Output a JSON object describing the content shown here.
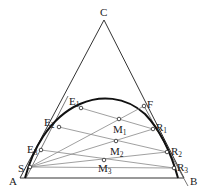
{
  "diagram": {
    "type": "ternary-phase-diagram",
    "vertices": {
      "apex": {
        "label": "C",
        "x": 104,
        "y": 20
      },
      "bottom_left": {
        "label": "A",
        "x": 20,
        "y": 178
      },
      "bottom_right": {
        "label": "B",
        "x": 184,
        "y": 178
      }
    },
    "points": {
      "S": {
        "label": "S",
        "x": 30,
        "y": 167
      },
      "F": {
        "label": "F",
        "x": 144,
        "y": 106
      },
      "E1": {
        "label": "E",
        "sub": "1",
        "x": 81,
        "y": 108
      },
      "E2": {
        "label": "E",
        "sub": "2",
        "x": 59,
        "y": 127
      },
      "E3": {
        "label": "E",
        "sub": "3",
        "x": 41,
        "y": 150
      },
      "R1": {
        "label": "R",
        "sub": "1",
        "x": 153,
        "y": 129
      },
      "R2": {
        "label": "R",
        "sub": "2",
        "x": 167,
        "y": 152
      },
      "R3": {
        "label": "R",
        "sub": "3",
        "x": 174,
        "y": 168
      },
      "M1": {
        "label": "M",
        "sub": "1",
        "x": 119,
        "y": 119
      },
      "M2": {
        "label": "M",
        "sub": "2",
        "x": 116,
        "y": 141
      },
      "M3": {
        "label": "M",
        "sub": "3",
        "x": 104,
        "y": 160
      }
    },
    "tie_lines": [
      [
        "E1",
        "R1"
      ],
      [
        "E2",
        "R2"
      ],
      [
        "E3",
        "R3"
      ]
    ],
    "operating_lines": [
      [
        "S",
        "F"
      ],
      [
        "S",
        "R1"
      ],
      [
        "S",
        "R2"
      ],
      [
        "S",
        "R3"
      ]
    ],
    "colors": {
      "outline": "#333333",
      "curve": "#111111",
      "thin": "#777777",
      "point_fill": "#ffffff"
    }
  }
}
